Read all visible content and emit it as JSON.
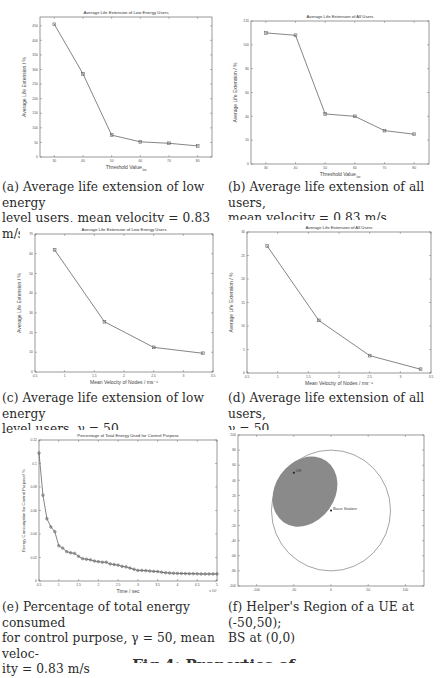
{
  "figure": {
    "title_partial": "Fig 4: Properties of ..."
  },
  "colors": {
    "line": "#666666",
    "axis": "#555555",
    "region_fill": "#8a8a8a",
    "text": "#2a2a2a"
  },
  "captions": {
    "a": "(a) Average life extension of low energy level users, mean velocity = 0.83 m/s",
    "b": "(b) Average life extension of all users, mean velocity = 0.83 m/s",
    "c": "(c) Average life extension of low energy level users, γ = 50",
    "d": "(d) Average life extension of all users, γ = 50",
    "e": "(e) Percentage of total energy consumed for control purpose, γ = 50, mean velocity = 0.83 m/s",
    "f": "(f) Helper's Region of a UE at (-50,50); BS at (0,0)"
  },
  "caption_lines": {
    "a1": "(a) Average life extension of low energy",
    "a2": "level users, mean velocity = 0.83 m/s",
    "b1": "(b) Average life extension of all users,",
    "b2": "mean velocity = 0.83 m/s",
    "c1": "(c) Average life extension of low energy",
    "c2": "level users, γ = 50",
    "d1": "(d) Average life extension of all users,",
    "d2": "γ = 50",
    "e1": "(e) Percentage of total energy consumed",
    "e2": "for control purpose, γ = 50, mean veloc-",
    "e3": "ity = 0.83 m/s",
    "f1": "(f) Helper's Region of a UE at (-50,50);",
    "f2": "BS at (0,0)"
  },
  "chart_data": [
    {
      "id": "a",
      "type": "line",
      "title": "Average Life Extension of Low Energy Users",
      "xlabel": "Threshold Value",
      "xlabel_sub": "low",
      "ylabel": "Average Life Extension / %",
      "x": [
        30,
        40,
        50,
        60,
        70,
        80
      ],
      "values": [
        455,
        285,
        75,
        52,
        47,
        38
      ],
      "xlim": [
        25,
        85
      ],
      "ylim": [
        0,
        480
      ],
      "xticks": [
        30,
        40,
        50,
        60,
        70,
        80
      ],
      "yticks": [
        0,
        50,
        100,
        150,
        200,
        250,
        300,
        350,
        400,
        450
      ],
      "grid": false,
      "marker": "square"
    },
    {
      "id": "b",
      "type": "line",
      "title": "Average Life Extension of All Users",
      "xlabel": "Threshold Value",
      "xlabel_sub": "low",
      "ylabel": "Average Life Extension / %",
      "x": [
        30,
        40,
        50,
        60,
        70,
        80
      ],
      "values": [
        110,
        108,
        42,
        40,
        28,
        25
      ],
      "xlim": [
        25,
        85
      ],
      "ylim": [
        0,
        120
      ],
      "xticks": [
        30,
        40,
        50,
        60,
        70,
        80
      ],
      "yticks": [
        0,
        20,
        40,
        60,
        80,
        100,
        120
      ],
      "grid": false,
      "marker": "square"
    },
    {
      "id": "c",
      "type": "line",
      "title": "Average Life Extension of Low Energy Users",
      "xlabel": "Mean Velocity of Nodes / ms⁻¹",
      "ylabel": "Average Life Extension / %",
      "x": [
        0.83,
        1.67,
        2.5,
        3.33
      ],
      "values": [
        62,
        25.5,
        12.5,
        9.5
      ],
      "xlim": [
        0.5,
        3.5
      ],
      "ylim": [
        0,
        70
      ],
      "xticks": [
        0.5,
        1,
        1.5,
        2,
        2.5,
        3,
        3.5
      ],
      "yticks": [
        0,
        10,
        20,
        30,
        40,
        50,
        60,
        70
      ],
      "grid": false,
      "marker": "square"
    },
    {
      "id": "d",
      "type": "line",
      "title": "Average Life Extension of All Users",
      "xlabel": "Mean Velocity of Nodes / ms⁻¹",
      "ylabel": "Average Life Extension / %",
      "x": [
        0.83,
        1.67,
        2.5,
        3.33
      ],
      "values": [
        27,
        11.2,
        3.7,
        0.8
      ],
      "xlim": [
        0.5,
        3.5
      ],
      "ylim": [
        0,
        30
      ],
      "xticks": [
        0.5,
        1,
        1.5,
        2,
        2.5,
        3,
        3.5
      ],
      "yticks": [
        0,
        5,
        10,
        15,
        20,
        25,
        30
      ],
      "grid": false,
      "marker": "square"
    },
    {
      "id": "e",
      "type": "line",
      "title": "Percentage of Total Energy Used for Control Purpose",
      "xlabel": "Time / sec",
      "x_multiplier": "x 10^4",
      "ylabel": "Energy Consumption for Control Purpose/ %",
      "x": [
        0.5,
        0.6,
        0.7,
        0.8,
        0.9,
        1.0,
        1.1,
        1.2,
        1.3,
        1.4,
        1.5,
        1.6,
        1.7,
        1.8,
        1.9,
        2.0,
        2.1,
        2.2,
        2.3,
        2.4,
        2.5,
        2.6,
        2.7,
        2.8,
        2.9,
        3.0,
        3.1,
        3.2,
        3.3,
        3.4,
        3.5,
        3.6,
        3.7,
        3.8,
        3.9,
        4.0,
        4.1,
        4.2,
        4.3,
        4.4,
        4.5,
        4.6,
        4.7,
        4.8,
        4.9,
        5.0
      ],
      "values": [
        0.109,
        0.073,
        0.053,
        0.046,
        0.042,
        0.03,
        0.028,
        0.025,
        0.024,
        0.0235,
        0.021,
        0.019,
        0.0185,
        0.018,
        0.017,
        0.0165,
        0.016,
        0.016,
        0.0145,
        0.014,
        0.0135,
        0.0125,
        0.012,
        0.011,
        0.01,
        0.009,
        0.009,
        0.0088,
        0.0085,
        0.0082,
        0.008,
        0.0075,
        0.007,
        0.0068,
        0.0066,
        0.0065,
        0.0064,
        0.0063,
        0.0062,
        0.0062,
        0.0061,
        0.006,
        0.006,
        0.006,
        0.006,
        0.006
      ],
      "xlim": [
        0.5,
        5
      ],
      "ylim": [
        0,
        0.12
      ],
      "xticks": [
        0.5,
        1,
        1.5,
        2,
        2.5,
        3,
        3.5,
        4,
        4.5,
        5
      ],
      "yticks": [
        0,
        0.02,
        0.04,
        0.06,
        0.08,
        0.1,
        0.12
      ],
      "grid": false,
      "marker": "circle"
    },
    {
      "id": "f",
      "type": "scatter",
      "title": "",
      "xlabel": "",
      "ylabel": "",
      "xlim": [
        -125,
        125
      ],
      "ylim": [
        -100,
        100
      ],
      "xticks": [
        -100,
        -50,
        0,
        50,
        100
      ],
      "yticks": [
        -100,
        -80,
        -60,
        -40,
        -20,
        0,
        20,
        40,
        60,
        80,
        100
      ],
      "points": [
        {
          "label": "UE",
          "x": -50,
          "y": 50
        },
        {
          "label": "Base Station",
          "x": 0,
          "y": 0
        }
      ],
      "shapes": [
        {
          "type": "circle",
          "cx": 0,
          "cy": 0,
          "r": 80,
          "fill": "none"
        },
        {
          "type": "ellipse",
          "cx": -35,
          "cy": 25,
          "rx": 40,
          "ry": 43,
          "rotation_deg": 35,
          "fill": "#8a8a8a",
          "label": "helper region"
        }
      ],
      "grid": false
    }
  ]
}
